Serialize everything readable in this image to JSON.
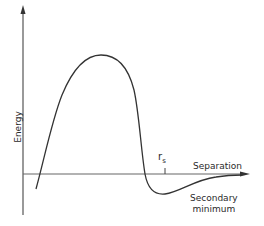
{
  "diagram": {
    "type": "energy-separation curve",
    "axes": {
      "y_label": "Energy",
      "x_label": "Separation"
    },
    "annotations": {
      "tick_label_main": "r",
      "tick_label_sub": "s",
      "secondary_minimum_line1": "Secondary",
      "secondary_minimum_line2": "minimum"
    },
    "colors": {
      "line": "#333333",
      "axis": "#555555",
      "background": "#ffffff"
    }
  }
}
